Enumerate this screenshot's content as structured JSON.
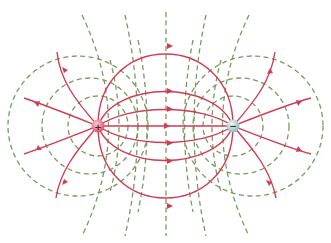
{
  "diagram": {
    "charges": [
      {
        "id": "positive",
        "sign": "+",
        "x": 98,
        "y": 126,
        "color": "#e8607a"
      },
      {
        "id": "negative",
        "sign": "−",
        "x": 233,
        "y": 126,
        "color": "#a9c9c9"
      }
    ],
    "legend": {
      "field_lines": {
        "style": "solid",
        "color": "#d23a55"
      },
      "equipotentials": {
        "style": "dashed",
        "color": "#7a9a5e"
      }
    }
  }
}
